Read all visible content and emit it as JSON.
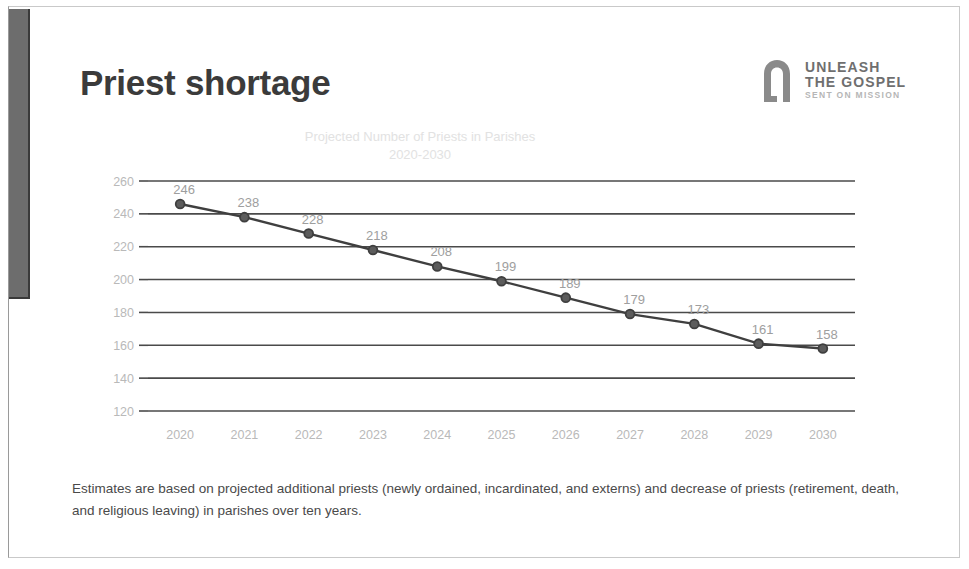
{
  "slide": {
    "title": "Priest shortage",
    "caption": "Estimates are based on projected additional priests (newly ordained, incardinated, and externs) and decrease of priests (retirement, death, and religious leaving) in parishes over ten years."
  },
  "logo": {
    "mark_name": "arch-doorway-icon",
    "line1": "UNLEASH",
    "line2": "THE GOSPEL",
    "line3": "SENT ON MISSION"
  },
  "chart_data": {
    "type": "line",
    "title": "Projected Number of Priests in Parishes",
    "subtitle": "2020-2030",
    "xlabel": "",
    "ylabel": "",
    "ylim": [
      120,
      260
    ],
    "ytick_step": 20,
    "yticks": [
      260,
      240,
      220,
      200,
      180,
      160,
      140,
      120
    ],
    "grid": true,
    "legend": "none",
    "marker": "circle",
    "line_color": "#3f3f3f",
    "grid_color": "#4a4a4a",
    "label_color": "#9e9e9e",
    "tick_color": "#b9b9b9",
    "categories": [
      "2020",
      "2021",
      "2022",
      "2023",
      "2024",
      "2025",
      "2026",
      "2027",
      "2028",
      "2029",
      "2030"
    ],
    "values": [
      246,
      238,
      228,
      218,
      208,
      199,
      189,
      179,
      173,
      161,
      158
    ],
    "data_labels": [
      "246",
      "238",
      "228",
      "218",
      "208",
      "199",
      "189",
      "179",
      "173",
      "161",
      "158"
    ]
  }
}
